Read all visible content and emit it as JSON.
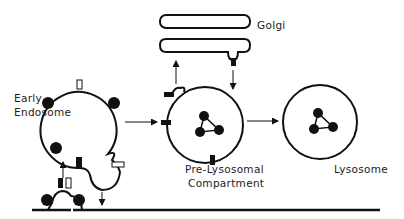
{
  "diagram": {
    "labels": {
      "golgi": "Golgi",
      "early_endosome_line1": "Early",
      "early_endosome_line2": "Endosome",
      "prelysosomal_line1": "Pre-Lysosomal",
      "prelysosomal_line2": "Compartment",
      "lysosome": "Lysosome"
    },
    "compartments": [
      {
        "name": "Plasma membrane",
        "shape": "line"
      },
      {
        "name": "Early Endosome",
        "shape": "circle with tubular extension"
      },
      {
        "name": "Golgi",
        "shape": "two stacked cisternae"
      },
      {
        "name": "Pre-Lysosomal Compartment",
        "shape": "circle with cargo"
      },
      {
        "name": "Lysosome",
        "shape": "circle with cargo"
      }
    ],
    "arrows": [
      {
        "from": "Plasma membrane pit",
        "to": "Early Endosome"
      },
      {
        "from": "Early Endosome tubule",
        "to": "Plasma membrane"
      },
      {
        "from": "Early Endosome",
        "to": "Pre-Lysosomal Compartment"
      },
      {
        "from": "Pre-Lysosomal Compartment",
        "to": "Golgi"
      },
      {
        "from": "Golgi",
        "to": "Pre-Lysosomal Compartment"
      },
      {
        "from": "Pre-Lysosomal Compartment",
        "to": "Lysosome"
      }
    ],
    "colors": {
      "stroke": "#111111",
      "background": "#ffffff"
    }
  }
}
